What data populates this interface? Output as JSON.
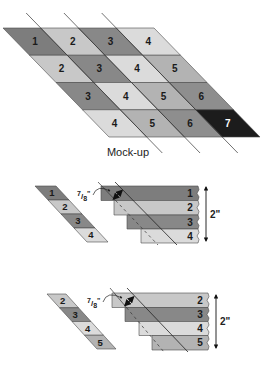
{
  "diagram": {
    "colors": {
      "1": "#7d7d7d",
      "2": "#c8c8c8",
      "3": "#888888",
      "4": "#dbdbdb",
      "5": "#b3b3b3",
      "6": "#8e8e8e",
      "7": "#1c1c1c"
    },
    "label_dark": "#1a1a1a",
    "label_light": "#ffffff",
    "mockup": {
      "caption": "Mock-up",
      "rows": [
        [
          "1",
          "2",
          "3",
          "4"
        ],
        [
          "2",
          "3",
          "4",
          "5"
        ],
        [
          "3",
          "4",
          "5",
          "6"
        ],
        [
          "4",
          "5",
          "6",
          "7"
        ]
      ]
    },
    "step1": {
      "strip_set": [
        "1",
        "2",
        "3",
        "4"
      ],
      "staggered_strips": [
        "1",
        "2",
        "3",
        "4"
      ],
      "offset_label": {
        "num": "7",
        "den": "8",
        "unit": "\""
      },
      "height_label": "2\""
    },
    "step2": {
      "strip_set": [
        "2",
        "3",
        "4",
        "5"
      ],
      "staggered_strips": [
        "2",
        "3",
        "4",
        "5"
      ],
      "offset_label": {
        "num": "7",
        "den": "8",
        "unit": "\""
      },
      "height_label": "2\""
    }
  }
}
